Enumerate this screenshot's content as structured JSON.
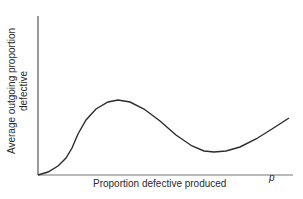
{
  "chart_data": {
    "type": "line",
    "title": "",
    "xlabel": "Proportion defective produced",
    "xvar": "p",
    "ylabel_line1": "Average outgoing proportion",
    "ylabel_line2": "defective",
    "grid": false,
    "legend": null,
    "axis_ticks": "none",
    "curve_description": "Rises from origin with S-shape to a maximum, falls to a minimum, then rises again",
    "series": [
      {
        "name": "AOQ curve",
        "points_px": [
          [
            38,
            175
          ],
          [
            48,
            172
          ],
          [
            58,
            166
          ],
          [
            66,
            158
          ],
          [
            72,
            148
          ],
          [
            78,
            134
          ],
          [
            86,
            120
          ],
          [
            96,
            109
          ],
          [
            108,
            102
          ],
          [
            118,
            100
          ],
          [
            130,
            102
          ],
          [
            144,
            109
          ],
          [
            160,
            121
          ],
          [
            176,
            135
          ],
          [
            192,
            146
          ],
          [
            204,
            151
          ],
          [
            214,
            152
          ],
          [
            226,
            151
          ],
          [
            240,
            147
          ],
          [
            256,
            139
          ],
          [
            272,
            129
          ],
          [
            289,
            118
          ]
        ]
      }
    ],
    "colors": {
      "line": "#2b2b2b",
      "axis": "#555555",
      "background": "#ffffff"
    }
  }
}
